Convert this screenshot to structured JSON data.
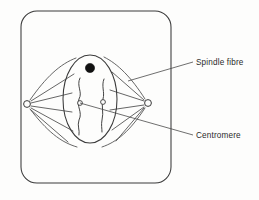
{
  "diagram": {
    "stroke_color": "#3a3a3a",
    "fill_color": "#111111",
    "background_color": "#fdfdfc"
  },
  "labels": {
    "spindle_fibre": {
      "text": "Spindle fibre",
      "leader_from": [
        193,
        62
      ],
      "leader_to": [
        128,
        81
      ]
    },
    "centromere": {
      "text": "Centromere",
      "leader_from": [
        193,
        135
      ],
      "leader_to": [
        80,
        103
      ]
    }
  },
  "structures": {
    "cell_membrane": {
      "name": "cell membrane",
      "shape": "rounded-rectangle",
      "x": 21,
      "y": 11,
      "width": 150,
      "height": 172,
      "radius": 16
    },
    "nucleus": {
      "name": "nuclear envelope",
      "shape": "ellipse",
      "cx": 90,
      "cy": 99,
      "rx": 27,
      "ry": 44
    },
    "nucleolus": {
      "name": "nucleolus",
      "shape": "filled-circle",
      "cx": 90,
      "cy": 68,
      "r": 4.6
    },
    "chromosomes": [
      {
        "name": "chromosome-left",
        "centromere_cx": 80,
        "centromere_cy": 103,
        "centromere_r": 2.4
      },
      {
        "name": "chromosome-right",
        "centromere_cx": 103,
        "centromere_cy": 102,
        "centromere_r": 2.4
      }
    ],
    "centrioles": [
      {
        "name": "centriole-left",
        "cx": 27,
        "cy": 104,
        "r": 3.4
      },
      {
        "name": "centriole-right",
        "cx": 148,
        "cy": 103,
        "r": 3.4
      }
    ],
    "spindle_fibre_count": 10
  }
}
